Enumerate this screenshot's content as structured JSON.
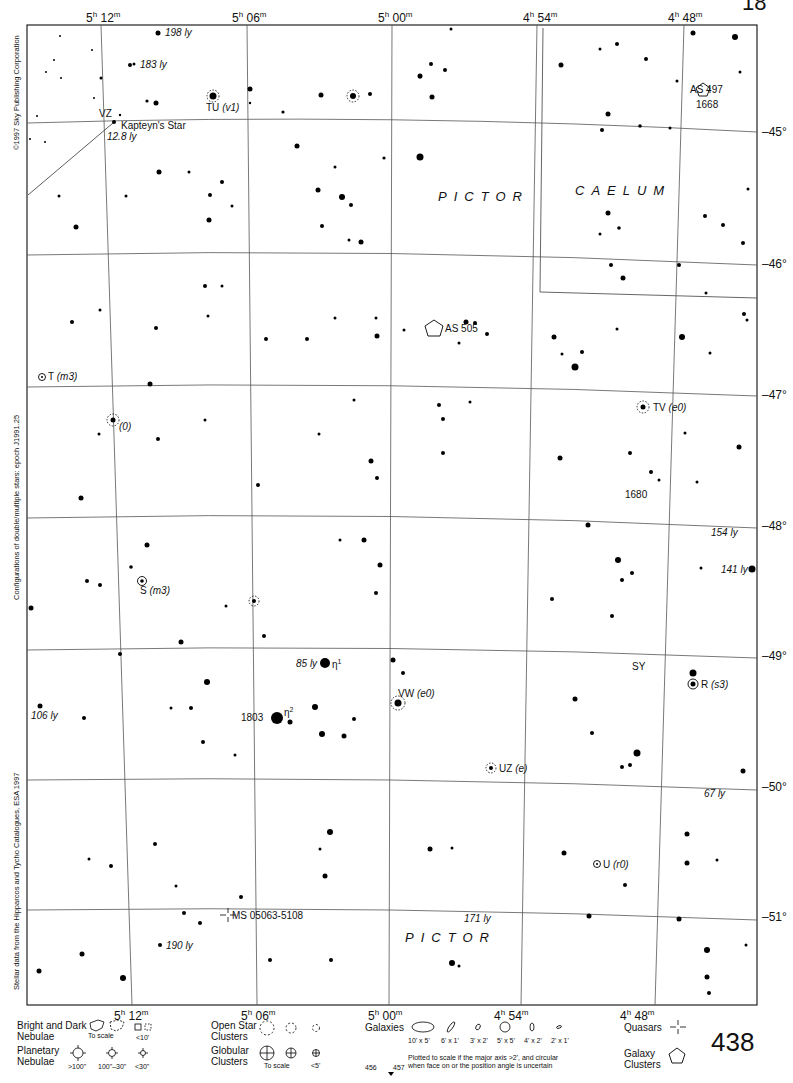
{
  "page": {
    "number": "438",
    "corner_fragment": "18",
    "adjacent_pages": {
      "left": "456",
      "right": "457"
    }
  },
  "credits": {
    "copyright": "©1997 Sky Publishing Corporation",
    "epoch_note": "Configurations of double/multiple stars: epoch J1991.25",
    "data_source": "Stellar data from the Hipparcos and Tycho Catalogues, ESA 1997"
  },
  "axes": {
    "ra_top": [
      {
        "h": "5",
        "m": "12"
      },
      {
        "h": "5",
        "m": "06"
      },
      {
        "h": "5",
        "m": "00"
      },
      {
        "h": "4",
        "m": "54"
      },
      {
        "h": "4",
        "m": "48"
      }
    ],
    "ra_bottom": [
      {
        "h": "5",
        "m": "12"
      },
      {
        "h": "5",
        "m": "06"
      },
      {
        "h": "5",
        "m": "00"
      },
      {
        "h": "4",
        "m": "54"
      },
      {
        "h": "4",
        "m": "48"
      }
    ],
    "dec": [
      "–45°",
      "–46°",
      "–47°",
      "–48°",
      "–49°",
      "–50°",
      "–51°"
    ]
  },
  "constellations": [
    {
      "name": "PICTOR",
      "id": "pictor-upper"
    },
    {
      "name": "CAELUM",
      "id": "caelum"
    },
    {
      "name": "PICTOR",
      "id": "pictor-lower"
    }
  ],
  "objects": {
    "ly_198": "198 ly",
    "ly_183": "183 ly",
    "tu_name": "TU",
    "tu_type": "(v1)",
    "vz": "VZ",
    "kapteyn": "Kapteyn's Star",
    "kapteyn_dist": "12.8 ly",
    "as497": "AS 497",
    "ngc1668": "1668",
    "as505": "AS 505",
    "t_name": "T",
    "t_type": "(m3)",
    "zero": "(0)",
    "tv_name": "TV",
    "tv_type": "(e0)",
    "ngc1680": "1680",
    "ly_154": "154 ly",
    "ly_141": "141 ly",
    "s_name": "S",
    "s_type": "(m3)",
    "ly_85": "85 ly",
    "eta1": "η",
    "eta1_sup": "1",
    "eta2": "η",
    "eta2_sup": "2",
    "ngc1803": "1803",
    "vw_name": "VW",
    "vw_type": "(e0)",
    "sy": "SY",
    "r_name": "R",
    "r_type": "(s3)",
    "ly_106": "106 ly",
    "uz_name": "UZ",
    "uz_type": "(e)",
    "ly_67": "67 ly",
    "u_name": "U",
    "u_type": "(r0)",
    "quasar": "MS 05063-5108",
    "ly_171": "171 ly",
    "ly_190": "190 ly"
  },
  "legend": {
    "nebulae_title": "Bright and Dark\nNebulae",
    "nebulae_to_scale": "To scale",
    "nebulae_small": "<10'",
    "planetary_title": "Planetary\nNebulae",
    "planetary_sizes": [
      ">100\"",
      "100\"–30\"",
      "<30\""
    ],
    "open_title": "Open Star\nClusters",
    "globular_title": "Globular\nClusters",
    "globular_to_scale": "To scale",
    "globular_small": "<5'",
    "galaxies_title": "Galaxies",
    "galaxy_sizes": [
      "10' x 5'",
      "6' x 1'",
      "3' x 2'",
      "5' x 5'",
      "4' x 2'",
      "2' x 1'"
    ],
    "galaxy_note": "Plotted to scale if the major axis >2', and circular\nwhen face on or the position angle is uncertain",
    "quasars_title": "Quasars",
    "galaxy_clusters_title": "Galaxy\nClusters"
  },
  "colors": {
    "ink": "#111111",
    "grid": "#555555",
    "paper": "#ffffff"
  }
}
